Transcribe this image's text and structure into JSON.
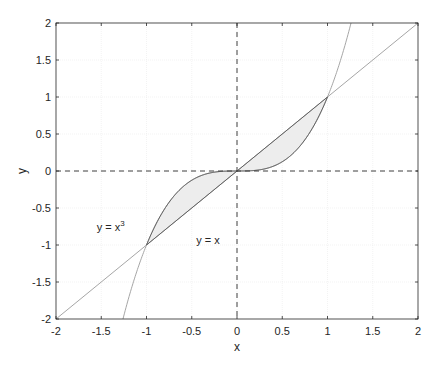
{
  "chart_data": {
    "type": "line",
    "title": "",
    "xlabel": "x",
    "ylabel": "y",
    "xlim": [
      -2,
      2
    ],
    "ylim": [
      -2,
      2
    ],
    "xticks": [
      -2,
      -1.5,
      -1,
      -0.5,
      0,
      0.5,
      1,
      1.5,
      2
    ],
    "yticks": [
      -2,
      -1.5,
      -1,
      -0.5,
      0,
      0.5,
      1,
      1.5,
      2
    ],
    "xtick_labels": [
      "-2",
      "-1.5",
      "-1",
      "-0.5",
      "0",
      "0.5",
      "1",
      "1.5",
      "2"
    ],
    "ytick_labels": [
      "-2",
      "-1.5",
      "-1",
      "-0.5",
      "0",
      "0.5",
      "1",
      "1.5",
      "2"
    ],
    "grid": true,
    "series": [
      {
        "name": "y = x^3",
        "expression": "x^3",
        "color": "#a6a6a6"
      },
      {
        "name": "y = x",
        "expression": "x",
        "color": "#a6a6a6"
      }
    ],
    "shaded_region": {
      "between": [
        "y = x",
        "y = x^3"
      ],
      "x_range": [
        -1,
        1
      ],
      "fill": "#ededed",
      "edge_color": "#595959"
    },
    "reference_lines": [
      {
        "orientation": "horizontal",
        "value": 0,
        "style": "dashed",
        "color": "#404040"
      },
      {
        "orientation": "vertical",
        "value": 0,
        "style": "dashed",
        "color": "#404040"
      }
    ],
    "intersections": [
      [
        -1,
        -1
      ],
      [
        0,
        0
      ],
      [
        1,
        1
      ]
    ],
    "annotations": [
      {
        "text": "y = x",
        "superscript": "3",
        "x": -1.55,
        "y": -0.75
      },
      {
        "text": "y = x",
        "superscript": "",
        "x": -0.45,
        "y": -0.93
      }
    ],
    "legend": null
  },
  "labels": {
    "xlabel": "x",
    "ylabel": "y",
    "annot_cubic_base": "y = x",
    "annot_cubic_sup": "3",
    "annot_linear": "y = x"
  }
}
